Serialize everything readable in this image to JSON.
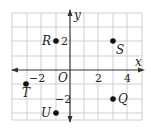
{
  "diagram": {
    "type": "coordinate-plane",
    "axes": {
      "x_label": "x",
      "y_label": "y",
      "origin_label": "O"
    },
    "tick_labels": {
      "x": [
        {
          "value": -2,
          "text": "−2"
        },
        {
          "value": 2,
          "text": "2"
        },
        {
          "value": 4,
          "text": "4"
        }
      ],
      "y": [
        {
          "value": 2,
          "text": "2"
        },
        {
          "value": -2,
          "text": "−2"
        }
      ]
    },
    "grid": {
      "x_range": [
        -4,
        5
      ],
      "y_range": [
        -3.5,
        4
      ],
      "step": 1
    },
    "points": [
      {
        "label": "R",
        "x": -1,
        "y": 2
      },
      {
        "label": "S",
        "x": 3,
        "y": 2
      },
      {
        "label": "T",
        "x": -3,
        "y": -1
      },
      {
        "label": "Q",
        "x": 3,
        "y": -2
      },
      {
        "label": "U",
        "x": -1,
        "y": -3
      }
    ],
    "colors": {
      "grid": "#cfcfcf",
      "axis": "#333333",
      "point": "#111111",
      "border": "#bbbbbb"
    }
  }
}
